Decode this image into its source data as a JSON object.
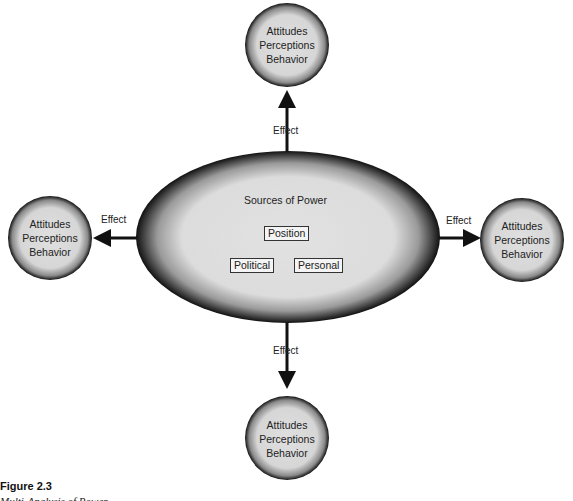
{
  "center": {
    "title": "Sources of Power",
    "sources": [
      "Position",
      "Political",
      "Personal"
    ]
  },
  "outcomes": {
    "top": {
      "lines": [
        "Attitudes",
        "Perceptions",
        "Behavior"
      ],
      "arrow_label": "Effect"
    },
    "left": {
      "lines": [
        "Attitudes",
        "Perceptions",
        "Behavior"
      ],
      "arrow_label": "Effect"
    },
    "right": {
      "lines": [
        "Attitudes",
        "Perceptions",
        "Behavior"
      ],
      "arrow_label": "Effect"
    },
    "bottom": {
      "lines": [
        "Attitudes",
        "Perceptions",
        "Behavior"
      ],
      "arrow_label": "Effect"
    }
  },
  "caption": {
    "figure": "Figure 2.3",
    "subtitle": "Multi-Analysis of Power"
  },
  "colors": {
    "fill": "#e0e0e0",
    "edge": "#1a1a1a"
  }
}
